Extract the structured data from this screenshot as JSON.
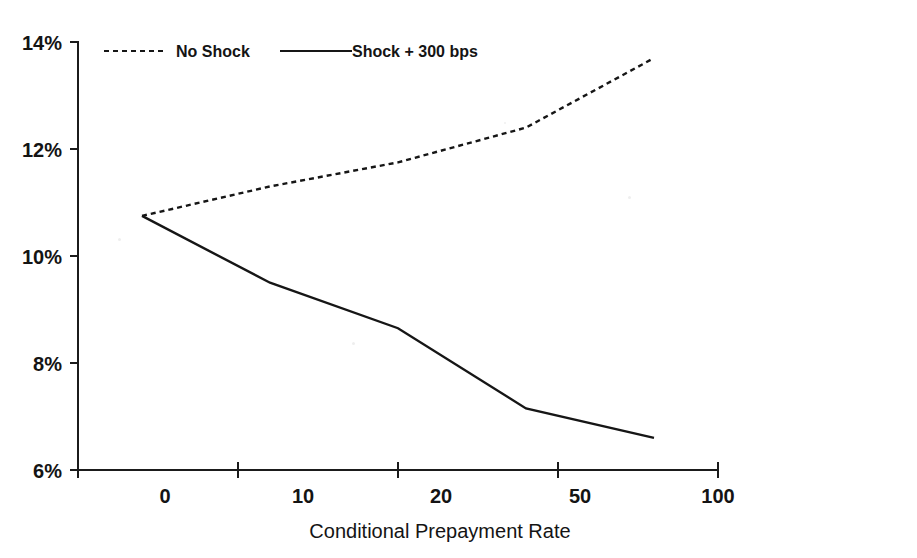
{
  "figure": {
    "cropped_title_fragment": "",
    "background_color": "#ffffff",
    "ink_color": "#161616"
  },
  "chart_data": {
    "type": "line",
    "title": "",
    "xlabel": "Conditional Prepayment Rate",
    "ylabel": "",
    "categories": [
      "0",
      "10",
      "20",
      "50",
      "100"
    ],
    "x_tick_labels": [
      "0",
      "10",
      "20",
      "50",
      "100"
    ],
    "y_tick_labels": [
      "6%",
      "8%",
      "10%",
      "12%",
      "14%"
    ],
    "ylim": [
      6,
      14
    ],
    "y_tick_values": [
      6,
      8,
      10,
      12,
      14
    ],
    "y_unit": "%",
    "grid": false,
    "legend_position": "top-left-inside",
    "series": [
      {
        "name": "No Shock",
        "style": "dashed",
        "values": [
          10.75,
          11.3,
          11.75,
          12.4,
          13.7
        ]
      },
      {
        "name": "Shock + 300 bps",
        "style": "solid",
        "values": [
          10.75,
          9.5,
          8.65,
          7.15,
          6.6
        ]
      }
    ],
    "annotations": []
  },
  "legend": {
    "items": [
      {
        "label": "No Shock",
        "style": "dashed"
      },
      {
        "label": "Shock + 300 bps",
        "style": "solid"
      }
    ]
  },
  "axes": {
    "y_axis_name": "y-axis",
    "x_axis_name": "x-axis",
    "x_axis_title": "Conditional Prepayment Rate"
  }
}
